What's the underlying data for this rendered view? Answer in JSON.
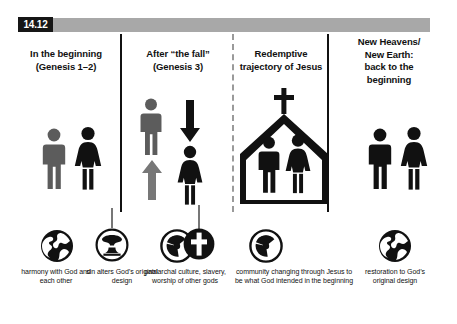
{
  "figure": {
    "number": "14.12",
    "accent_gray": "#a8a8a8",
    "ink": "#111111",
    "figure_gray": "#5c5c5c"
  },
  "columns": [
    {
      "id": "beginning",
      "heading_line1": "In the beginning",
      "heading_line2": "(Genesis 1–2)"
    },
    {
      "id": "after-the-fall",
      "heading_line1": "After “the fall”",
      "heading_line2": "(Genesis 3)"
    },
    {
      "id": "redemptive-trajectory",
      "heading_line1": "Redemptive",
      "heading_line2": "trajectory of Jesus"
    },
    {
      "id": "new-heavens-new-earth",
      "heading_line1": "New Heavens/",
      "heading_line2": "New Earth:",
      "heading_line3": "back to the",
      "heading_line4": "beginning"
    }
  ],
  "icons": [
    {
      "id": "globe-harmony",
      "glyph": "globe-icon"
    },
    {
      "id": "mushroom-cloud",
      "glyph": "mushroom-cloud-icon"
    },
    {
      "id": "radiation-fall",
      "glyph": "radiation-icon"
    },
    {
      "id": "cross-redemption",
      "glyph": "cross-icon"
    },
    {
      "id": "radiation-residual",
      "glyph": "radiation-icon"
    },
    {
      "id": "globe-restoration",
      "glyph": "globe-icon"
    }
  ],
  "captions": [
    {
      "id": "harmony",
      "text": "harmony with God and each other"
    },
    {
      "id": "sin-alters",
      "text": "sin alters God’s original design"
    },
    {
      "id": "patriarchal",
      "text": "patriarchal culture, slavery, worship of other gods"
    },
    {
      "id": "community",
      "text": "community changing through Jesus to be what God intended in the beginning"
    },
    {
      "id": "restoration",
      "text": "restoration to God’s original design"
    }
  ],
  "pictograms": {
    "col1_male": "male-figure",
    "col1_female": "female-figure",
    "col2_male": "male-figure",
    "col2_female": "female-figure",
    "col2_arrow_up": "arrow-up-icon",
    "col2_arrow_down": "arrow-down-icon",
    "col3_male": "male-figure",
    "col3_female": "female-figure",
    "col3_building": "church-icon",
    "col4_male": "male-figure",
    "col4_female": "female-figure"
  }
}
